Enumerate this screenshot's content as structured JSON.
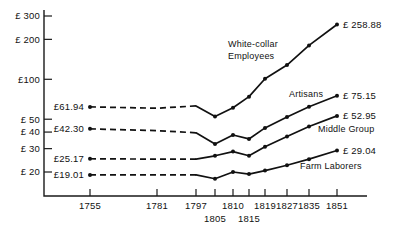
{
  "chart_data": {
    "type": "line",
    "title": "",
    "xlabel": "",
    "ylabel": "",
    "yscale": "log",
    "ylim": [
      17,
      330
    ],
    "grid": false,
    "legend_position": "inline-annotations",
    "currency_symbol": "£",
    "y_ticks": [
      "£ 300",
      "£ 200",
      "£100",
      "£ 50",
      "£ 40",
      "£ 30",
      "£ 20"
    ],
    "y_tick_values": [
      300,
      200,
      100,
      50,
      40,
      30,
      20
    ],
    "x": [
      1755,
      1781,
      1797,
      1805,
      1810,
      1815,
      1819,
      1827,
      1835,
      1851
    ],
    "x_tick_labels_row1": [
      "1755",
      "1781",
      "1797",
      "1810",
      "1819",
      "1827",
      "1835",
      "1851"
    ],
    "x_tick_labels_row2": [
      "1805",
      "1815"
    ],
    "series": [
      {
        "name": "White-collar Employees",
        "label": "White-collar\nEmployees",
        "label_line1": "White-collar",
        "label_line2": "Employees",
        "start_label": "£61.94",
        "end_label": "£ 258.88",
        "start_value": 61.94,
        "end_value": 258.88,
        "values": [
          61.94,
          60.5,
          63.0,
          52.5,
          61.0,
          74.0,
          101.0,
          128.0,
          180.0,
          258.88
        ],
        "dashed_until_index": 2
      },
      {
        "name": "Artisans",
        "label": "Artisans",
        "start_label": "£42.30",
        "end_label": "£ 75.15",
        "start_value": 42.3,
        "end_value": 75.15,
        "values": [
          42.3,
          41.0,
          39.5,
          32.5,
          38.0,
          35.5,
          43.0,
          52.0,
          62.0,
          75.15
        ],
        "dashed_until_index": 2
      },
      {
        "name": "Middle Group",
        "label": "Middle Group",
        "start_label": "£25.17",
        "end_label": "£ 52.95",
        "start_value": 25.17,
        "end_value": 52.95,
        "values": [
          25.17,
          25.0,
          25.0,
          26.5,
          28.5,
          26.5,
          31.0,
          37.0,
          44.0,
          52.95
        ],
        "dashed_until_index": 2
      },
      {
        "name": "Farm Laborers",
        "label": "Farm Laborers",
        "start_label": "£19.01",
        "end_label": "£ 29.04",
        "start_value": 19.01,
        "end_value": 29.04,
        "values": [
          19.01,
          19.0,
          19.0,
          17.8,
          20.0,
          19.3,
          20.5,
          22.5,
          25.0,
          29.04
        ],
        "dashed_until_index": 2
      }
    ]
  }
}
